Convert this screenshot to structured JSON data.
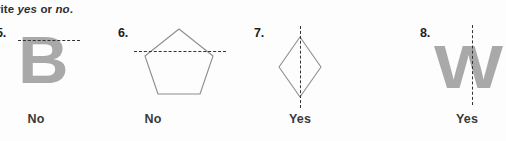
{
  "instruction": {
    "text_before": "rite ",
    "italic_1": "yes",
    "text_middle": " or ",
    "italic_2": "no",
    "text_after": "."
  },
  "colors": {
    "page_background": "#fdfdfd",
    "gray_letter": "#a9a9a9",
    "shape_outline": "#8e8e8e",
    "dashed_line": "#333333",
    "answer_text": "#3a3a3a",
    "number_text": "#1e1e1e"
  },
  "problems": [
    {
      "number": "5.",
      "figure_kind": "letter",
      "figure_label": "B",
      "symmetry_line": "horizontal",
      "answer": "No"
    },
    {
      "number": "6.",
      "figure_kind": "pentagon",
      "figure_label": "pentagon",
      "symmetry_line": "horizontal",
      "answer": "No"
    },
    {
      "number": "7.",
      "figure_kind": "rhombus",
      "figure_label": "rhombus",
      "symmetry_line": "vertical",
      "answer": "Yes"
    },
    {
      "number": "8.",
      "figure_kind": "letter",
      "figure_label": "W",
      "symmetry_line": "vertical",
      "answer": "Yes"
    }
  ]
}
